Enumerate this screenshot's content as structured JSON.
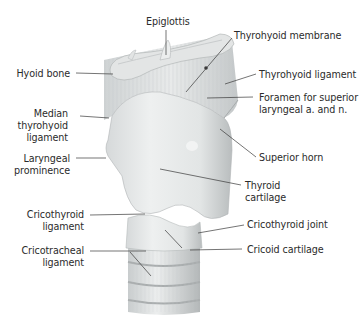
{
  "figure": {
    "colors": {
      "background": "#ffffff",
      "cartilage": "#e4e6e6",
      "cartilage_shadow": "#b8bcbd",
      "membrane": "#d9dcdc",
      "leader_line": "#3a3a3a",
      "label_text": "#2b2b2b"
    }
  },
  "labels": {
    "epiglottis": "Epiglottis",
    "thyrohyoid_membrane": "Thyrohyoid membrane",
    "hyoid_bone": "Hyoid bone",
    "thyrohyoid_ligament": "Thyrohyoid ligament",
    "foramen_line1": "Foramen for superior",
    "foramen_line2": "laryngeal a. and n.",
    "median_line1": "Median",
    "median_line2": "thyrohyoid",
    "median_line3": "ligament",
    "superior_horn": "Superior horn",
    "laryngeal_line1": "Laryngeal",
    "laryngeal_line2": "prominence",
    "thyroid_line1": "Thyroid",
    "thyroid_line2": "cartilage",
    "cricothyroid_lig_line1": "Cricothyroid",
    "cricothyroid_lig_line2": "ligament",
    "cricothyroid_joint": "Cricothyroid joint",
    "cricotracheal_line1": "Cricotracheal",
    "cricotracheal_line2": "ligament",
    "cricoid_cartilage": "Cricoid cartilage"
  }
}
